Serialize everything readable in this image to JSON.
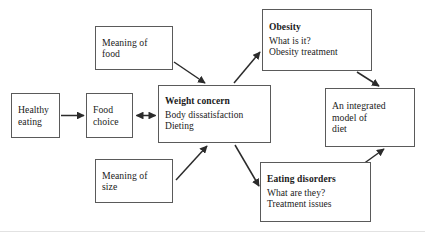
{
  "diagram": {
    "title": "An integrated model of diet",
    "type": "flow-diagram",
    "background_color": "#ffffff",
    "box_border_color": "#5a5a5a",
    "arrow_color": "#2b2b2b",
    "nodes": [
      {
        "id": "healthy-eating",
        "title": "",
        "lines": [
          "Healthy",
          "eating"
        ]
      },
      {
        "id": "food-choice",
        "title": "",
        "lines": [
          "Food",
          "choice"
        ]
      },
      {
        "id": "meaning-of-food",
        "title": "",
        "lines": [
          "Meaning of",
          "food"
        ]
      },
      {
        "id": "meaning-of-size",
        "title": "",
        "lines": [
          "Meaning of",
          "size"
        ]
      },
      {
        "id": "weight-concern",
        "title": "Weight concern",
        "lines": [
          "Body dissatisfaction",
          "Dieting"
        ]
      },
      {
        "id": "obesity",
        "title": "Obesity",
        "lines": [
          "What is it?",
          "Obesity treatment"
        ]
      },
      {
        "id": "eating-disorders",
        "title": "Eating disorders",
        "lines": [
          "What are they?",
          "Treatment issues"
        ]
      },
      {
        "id": "integrated-model",
        "title": "",
        "lines": [
          "An integrated",
          "model of",
          "diet"
        ]
      }
    ],
    "edges": [
      {
        "from": "healthy-eating",
        "to": "food-choice",
        "style": "single-arrow"
      },
      {
        "from": "food-choice",
        "to": "weight-concern",
        "style": "double-arrow"
      },
      {
        "from": "meaning-of-food",
        "to": "weight-concern",
        "style": "single-arrow"
      },
      {
        "from": "meaning-of-size",
        "to": "weight-concern",
        "style": "single-arrow"
      },
      {
        "from": "weight-concern",
        "to": "obesity",
        "style": "single-arrow"
      },
      {
        "from": "weight-concern",
        "to": "eating-disorders",
        "style": "single-arrow"
      },
      {
        "from": "obesity",
        "to": "integrated-model",
        "style": "single-arrow"
      },
      {
        "from": "eating-disorders",
        "to": "integrated-model",
        "style": "single-arrow"
      }
    ]
  }
}
